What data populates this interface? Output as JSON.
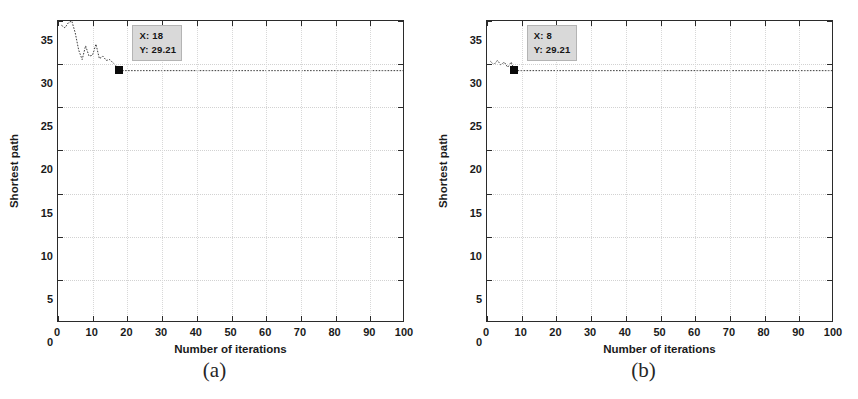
{
  "figure": {
    "background": "#ffffff",
    "panels": [
      {
        "caption": "(a)",
        "xlabel": "Number of iterations",
        "ylabel": "Shortest path",
        "datatip": {
          "x_text": "X: 18",
          "y_text": "Y: 29.21"
        }
      },
      {
        "caption": "(b)",
        "xlabel": "Number of iterations",
        "ylabel": "Shortest path",
        "datatip": {
          "x_text": "X: 8",
          "y_text": "Y: 29.21"
        }
      }
    ]
  },
  "chart_data": [
    {
      "type": "line",
      "title": "(a)",
      "xlabel": "Number of iterations",
      "ylabel": "Shortest path",
      "xlim": [
        0,
        100
      ],
      "ylim": [
        0,
        35
      ],
      "xticks": [
        0,
        10,
        20,
        30,
        40,
        50,
        60,
        70,
        80,
        90,
        100
      ],
      "yticks": [
        0,
        5,
        10,
        15,
        20,
        25,
        30,
        35
      ],
      "grid": true,
      "legend": null,
      "line_color": "#3a3a3a",
      "marker_color": "#0a0a0a",
      "annotation": {
        "label": "X: 18\nY: 29.21",
        "x": 18,
        "y": 29.21
      },
      "converged_at": {
        "x": 18,
        "y": 29.21
      },
      "x": [
        1,
        2,
        3,
        4,
        5,
        6,
        7,
        8,
        9,
        10,
        11,
        12,
        13,
        14,
        15,
        16,
        17,
        18,
        19,
        20,
        21,
        22,
        23,
        24,
        25,
        26,
        27,
        28,
        29,
        30,
        31,
        32,
        33,
        34,
        35,
        36,
        37,
        38,
        39,
        40,
        41,
        42,
        43,
        44,
        45,
        46,
        47,
        48,
        49,
        50,
        51,
        52,
        53,
        54,
        55,
        56,
        57,
        58,
        59,
        60,
        61,
        62,
        63,
        64,
        65,
        66,
        67,
        68,
        69,
        70,
        71,
        72,
        73,
        74,
        75,
        76,
        77,
        78,
        79,
        80,
        81,
        82,
        83,
        84,
        85,
        86,
        87,
        88,
        89,
        90,
        91,
        92,
        93,
        94,
        95,
        96,
        97,
        98,
        99,
        100
      ],
      "values": [
        34.5,
        34.2,
        34.8,
        35.0,
        33.6,
        31.6,
        30.5,
        32.1,
        30.9,
        31.0,
        32.3,
        30.6,
        30.9,
        30.4,
        30.5,
        30.1,
        29.7,
        29.21,
        29.21,
        29.21,
        29.21,
        29.21,
        29.21,
        29.21,
        29.21,
        29.21,
        29.21,
        29.21,
        29.21,
        29.21,
        29.21,
        29.21,
        29.21,
        29.21,
        29.21,
        29.21,
        29.21,
        29.21,
        29.21,
        29.21,
        29.21,
        29.21,
        29.21,
        29.21,
        29.21,
        29.21,
        29.21,
        29.21,
        29.21,
        29.21,
        29.21,
        29.21,
        29.21,
        29.21,
        29.21,
        29.21,
        29.21,
        29.21,
        29.21,
        29.21,
        29.21,
        29.21,
        29.21,
        29.21,
        29.21,
        29.21,
        29.21,
        29.21,
        29.21,
        29.21,
        29.21,
        29.21,
        29.21,
        29.21,
        29.21,
        29.21,
        29.21,
        29.21,
        29.21,
        29.21,
        29.21,
        29.21,
        29.21,
        29.21,
        29.21,
        29.21,
        29.21,
        29.21,
        29.21,
        29.21,
        29.21,
        29.21,
        29.21,
        29.21,
        29.21,
        29.21,
        29.21,
        29.21,
        29.21,
        29.21,
        29.21
      ]
    },
    {
      "type": "line",
      "title": "(b)",
      "xlabel": "Number of iterations",
      "ylabel": "Shortest path",
      "xlim": [
        0,
        100
      ],
      "ylim": [
        0,
        35
      ],
      "xticks": [
        0,
        10,
        20,
        30,
        40,
        50,
        60,
        70,
        80,
        90,
        100
      ],
      "yticks": [
        0,
        5,
        10,
        15,
        20,
        25,
        30,
        35
      ],
      "grid": true,
      "legend": null,
      "line_color": "#3a3a3a",
      "marker_color": "#0a0a0a",
      "annotation": {
        "label": "X: 8\nY: 29.21",
        "x": 8,
        "y": 29.21
      },
      "converged_at": {
        "x": 8,
        "y": 29.21
      },
      "x": [
        1,
        2,
        3,
        4,
        5,
        6,
        7,
        8,
        9,
        10,
        11,
        12,
        13,
        14,
        15,
        16,
        17,
        18,
        19,
        20,
        21,
        22,
        23,
        24,
        25,
        26,
        27,
        28,
        29,
        30,
        31,
        32,
        33,
        34,
        35,
        36,
        37,
        38,
        39,
        40,
        41,
        42,
        43,
        44,
        45,
        46,
        47,
        48,
        49,
        50,
        51,
        52,
        53,
        54,
        55,
        56,
        57,
        58,
        59,
        60,
        61,
        62,
        63,
        64,
        65,
        66,
        67,
        68,
        69,
        70,
        71,
        72,
        73,
        74,
        75,
        76,
        77,
        78,
        79,
        80,
        81,
        82,
        83,
        84,
        85,
        86,
        87,
        88,
        89,
        90,
        91,
        92,
        93,
        94,
        95,
        96,
        97,
        98,
        99,
        100
      ],
      "values": [
        30.3,
        29.9,
        30.4,
        29.9,
        30.2,
        29.6,
        30.2,
        29.21,
        29.21,
        29.21,
        29.21,
        29.21,
        29.21,
        29.21,
        29.21,
        29.21,
        29.21,
        29.21,
        29.21,
        29.21,
        29.21,
        29.21,
        29.21,
        29.21,
        29.21,
        29.21,
        29.21,
        29.21,
        29.21,
        29.21,
        29.21,
        29.21,
        29.21,
        29.21,
        29.21,
        29.21,
        29.21,
        29.21,
        29.21,
        29.21,
        29.21,
        29.21,
        29.21,
        29.21,
        29.21,
        29.21,
        29.21,
        29.21,
        29.21,
        29.21,
        29.21,
        29.21,
        29.21,
        29.21,
        29.21,
        29.21,
        29.21,
        29.21,
        29.21,
        29.21,
        29.21,
        29.21,
        29.21,
        29.21,
        29.21,
        29.21,
        29.21,
        29.21,
        29.21,
        29.21,
        29.21,
        29.21,
        29.21,
        29.21,
        29.21,
        29.21,
        29.21,
        29.21,
        29.21,
        29.21,
        29.21,
        29.21,
        29.21,
        29.21,
        29.21,
        29.21,
        29.21,
        29.21,
        29.21,
        29.21,
        29.21,
        29.21,
        29.21,
        29.21,
        29.21,
        29.21,
        29.21,
        29.21,
        29.21,
        29.21,
        29.21
      ]
    }
  ]
}
